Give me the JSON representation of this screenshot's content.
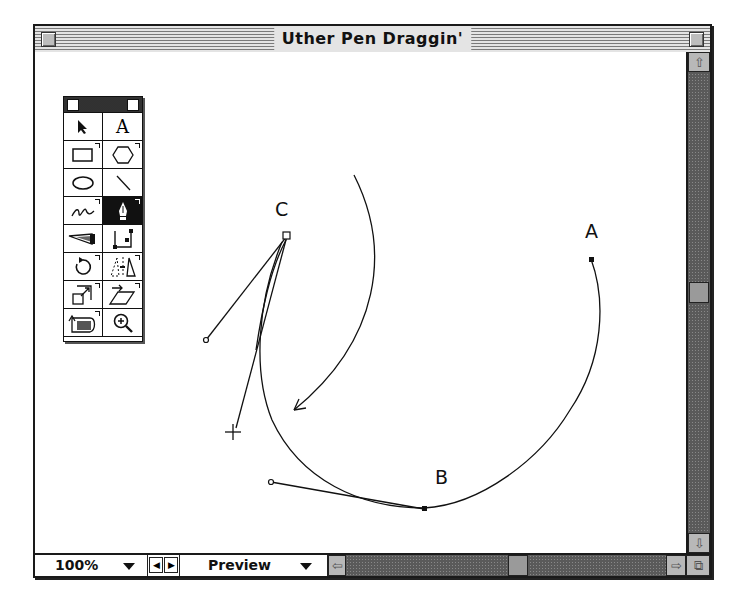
{
  "window": {
    "title": "Uther Pen Draggin'"
  },
  "toolbox": {
    "tools": [
      {
        "name": "arrow-tool",
        "icon": "arrow-icon"
      },
      {
        "name": "text-tool",
        "icon": "text-icon",
        "glyph": "A"
      },
      {
        "name": "rectangle-tool",
        "icon": "rectangle-icon"
      },
      {
        "name": "polygon-tool",
        "icon": "hexagon-icon"
      },
      {
        "name": "ellipse-tool",
        "icon": "ellipse-icon"
      },
      {
        "name": "line-tool",
        "icon": "line-icon"
      },
      {
        "name": "freehand-tool",
        "icon": "squiggle-icon"
      },
      {
        "name": "pen-tool",
        "icon": "pen-nib-icon",
        "selected": true
      },
      {
        "name": "blend-tool",
        "icon": "blend-icon"
      },
      {
        "name": "knife-tool",
        "icon": "bezier-path-icon"
      },
      {
        "name": "rotate-tool",
        "icon": "rotate-icon"
      },
      {
        "name": "reflect-tool",
        "icon": "reflect-icon"
      },
      {
        "name": "scale-tool",
        "icon": "scale-icon"
      },
      {
        "name": "skew-tool",
        "icon": "skew-icon"
      },
      {
        "name": "trace-tool",
        "icon": "trace-icon"
      },
      {
        "name": "zoom-tool",
        "icon": "magnifier-icon"
      }
    ]
  },
  "canvas": {
    "points": [
      {
        "label": "A",
        "x": 591,
        "y": 259
      },
      {
        "label": "B",
        "x": 424,
        "y": 508
      },
      {
        "label": "C",
        "x": 287,
        "y": 236
      }
    ]
  },
  "statusbar": {
    "zoom_value": "100%",
    "view_mode": "Preview"
  },
  "colors": {
    "scrollbar_track": "#5a5a5a",
    "scroll_thumb": "#9a9a9a",
    "selected_tool_bg": "#111111"
  }
}
